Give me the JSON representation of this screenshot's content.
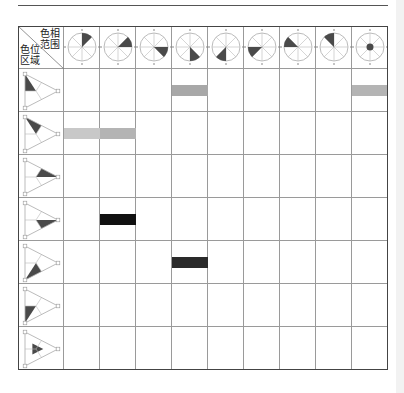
{
  "corner_header": {
    "top_right_label": [
      "色相",
      "范围"
    ],
    "bottom_left_label": [
      "色位",
      "区域"
    ]
  },
  "columns": [
    {
      "icon": "hue-range-sector-1",
      "sector_start_deg": 0,
      "sector_end_deg": 45
    },
    {
      "icon": "hue-range-sector-2",
      "sector_start_deg": 45,
      "sector_end_deg": 90
    },
    {
      "icon": "hue-range-sector-3",
      "sector_start_deg": 90,
      "sector_end_deg": 135
    },
    {
      "icon": "hue-range-sector-4",
      "sector_start_deg": 135,
      "sector_end_deg": 180
    },
    {
      "icon": "hue-range-sector-5",
      "sector_start_deg": 180,
      "sector_end_deg": 225
    },
    {
      "icon": "hue-range-sector-6",
      "sector_start_deg": 225,
      "sector_end_deg": 270
    },
    {
      "icon": "hue-range-sector-7",
      "sector_start_deg": 270,
      "sector_end_deg": 315
    },
    {
      "icon": "hue-range-sector-8",
      "sector_start_deg": 315,
      "sector_end_deg": 360
    },
    {
      "icon": "hue-range-center-dot",
      "sector_start_deg": null,
      "sector_end_deg": null
    }
  ],
  "rows": [
    {
      "icon": "color-region-triangle-1",
      "region": 0
    },
    {
      "icon": "color-region-triangle-2",
      "region": 1
    },
    {
      "icon": "color-region-triangle-3",
      "region": 2
    },
    {
      "icon": "color-region-triangle-4",
      "region": 3
    },
    {
      "icon": "color-region-triangle-5",
      "region": 4
    },
    {
      "icon": "color-region-triangle-6",
      "region": 5
    },
    {
      "icon": "color-region-triangle-7",
      "region": 6
    }
  ],
  "marks": [
    {
      "row": 0,
      "col": 3,
      "color": "#a8a8a8"
    },
    {
      "row": 0,
      "col": 8,
      "color": "#b4b4b4"
    },
    {
      "row": 1,
      "col": 0,
      "color": "#c8c8c8"
    },
    {
      "row": 1,
      "col": 1,
      "color": "#b4b4b4"
    },
    {
      "row": 3,
      "col": 1,
      "color": "#111111"
    },
    {
      "row": 4,
      "col": 3,
      "color": "#2a2a2a"
    }
  ],
  "colors": {
    "fill": "#4a4a4a",
    "line": "#9a9a9a",
    "border": "#444444"
  }
}
